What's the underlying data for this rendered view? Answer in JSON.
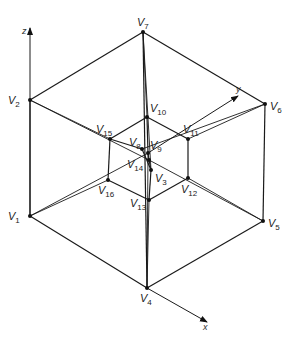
{
  "diagram": {
    "axes": {
      "z": {
        "label": "z",
        "x1": 30,
        "y1": 216,
        "x2": 30,
        "y2": 28
      },
      "y": {
        "label": "y",
        "x1": 148,
        "y1": 153,
        "x2": 238,
        "y2": 96
      },
      "x": {
        "label": "x",
        "x1": 147,
        "y1": 288,
        "x2": 207,
        "y2": 322
      }
    },
    "vertices": [
      {
        "id": "V1",
        "letter": "V",
        "num": "1",
        "x": 30,
        "y": 216,
        "lx": 8,
        "ly": 220
      },
      {
        "id": "V2",
        "letter": "V",
        "num": "2",
        "x": 30,
        "y": 100,
        "lx": 8,
        "ly": 104
      },
      {
        "id": "V3",
        "letter": "V",
        "num": "3",
        "x": 151,
        "y": 170,
        "lx": 155,
        "ly": 182
      },
      {
        "id": "V4",
        "letter": "V",
        "num": "4",
        "x": 147,
        "y": 288,
        "lx": 140,
        "ly": 302
      },
      {
        "id": "V5",
        "letter": "V",
        "num": "5",
        "x": 263,
        "y": 221,
        "lx": 268,
        "ly": 227
      },
      {
        "id": "V6",
        "letter": "V",
        "num": "6",
        "x": 265,
        "y": 104,
        "lx": 270,
        "ly": 110
      },
      {
        "id": "V7",
        "letter": "V",
        "num": "7",
        "x": 143,
        "y": 32,
        "lx": 137,
        "ly": 26
      },
      {
        "id": "V8",
        "letter": "V",
        "num": "8",
        "x": 142,
        "y": 149,
        "lx": 129,
        "ly": 146
      },
      {
        "id": "V9",
        "letter": "V",
        "num": "9",
        "x": 148,
        "y": 153,
        "lx": 150,
        "ly": 149
      },
      {
        "id": "V10",
        "letter": "V",
        "num": "10",
        "x": 147,
        "y": 117,
        "lx": 150,
        "ly": 112
      },
      {
        "id": "V11",
        "letter": "V",
        "num": "11",
        "x": 188,
        "y": 139,
        "lx": 183,
        "ly": 133
      },
      {
        "id": "V12",
        "letter": "V",
        "num": "12",
        "x": 188,
        "y": 178,
        "lx": 181,
        "ly": 193
      },
      {
        "id": "V13",
        "letter": "V",
        "num": "13",
        "x": 149,
        "y": 200,
        "lx": 130,
        "ly": 207
      },
      {
        "id": "V14",
        "letter": "V",
        "num": "14",
        "x": 149,
        "y": 160,
        "lx": 127,
        "ly": 168
      },
      {
        "id": "V15",
        "letter": "V",
        "num": "15",
        "x": 110,
        "y": 139,
        "lx": 96,
        "ly": 133
      },
      {
        "id": "V16",
        "letter": "V",
        "num": "16",
        "x": 108,
        "y": 180,
        "lx": 98,
        "ly": 194
      }
    ],
    "outer_edges": [
      [
        "V2",
        "V7"
      ],
      [
        "V7",
        "V6"
      ],
      [
        "V2",
        "V1"
      ],
      [
        "V6",
        "V5"
      ],
      [
        "V1",
        "V4"
      ],
      [
        "V4",
        "V5"
      ],
      [
        "V7",
        "V4"
      ]
    ],
    "inner_edges": [
      [
        "V10",
        "V15"
      ],
      [
        "V10",
        "V11"
      ],
      [
        "V15",
        "V16"
      ],
      [
        "V11",
        "V12"
      ],
      [
        "V16",
        "V13"
      ],
      [
        "V12",
        "V13"
      ],
      [
        "V10",
        "V9"
      ],
      [
        "V13",
        "V3"
      ],
      [
        "V15",
        "V8"
      ],
      [
        "V8",
        "V3"
      ],
      [
        "V9",
        "V14"
      ],
      [
        "V14",
        "V3"
      ]
    ],
    "connecting_edges": [
      [
        "V7",
        "V10"
      ],
      [
        "V2",
        "V15"
      ],
      [
        "V6",
        "V11"
      ],
      [
        "V1",
        "V16"
      ],
      [
        "V5",
        "V12"
      ],
      [
        "V4",
        "V13"
      ],
      [
        "V2",
        "V14"
      ],
      [
        "V6",
        "V8"
      ],
      [
        "V1",
        "V9"
      ],
      [
        "V5",
        "V14"
      ],
      [
        "V7",
        "V3"
      ],
      [
        "V4",
        "V9"
      ]
    ]
  }
}
